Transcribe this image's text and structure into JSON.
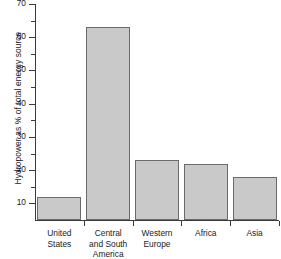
{
  "chart_data": {
    "type": "bar",
    "title": "",
    "subtitle": "",
    "xlabel": "",
    "ylabel": "Hydropower as % of total energy source",
    "categories": [
      "United States",
      "Central and South America",
      "Western Europe",
      "Africa",
      "Asia"
    ],
    "category_lines": [
      [
        "United States"
      ],
      [
        "Central",
        "and South",
        "America"
      ],
      [
        "Western Europe"
      ],
      [
        "Africa"
      ],
      [
        "Asia"
      ]
    ],
    "values": [
      12,
      63,
      23,
      22,
      18
    ],
    "ylim": [
      5,
      70
    ],
    "ytick_labels": [
      "10",
      "20",
      "30",
      "40",
      "50",
      "60",
      "70"
    ],
    "ytick_values": [
      10,
      20,
      30,
      40,
      50,
      60,
      70
    ],
    "yminor_values": [
      15,
      25,
      35,
      45,
      55,
      65
    ],
    "grid": false,
    "legend": null,
    "legend_position": "none",
    "bar_fill_color": "#c9c9c9",
    "bar_edge_color": "#6b6b6b",
    "axis_color": "#3a3a3a",
    "background_color": "#ffffff"
  }
}
